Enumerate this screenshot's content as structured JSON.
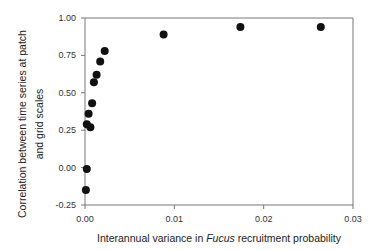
{
  "chart_data": {
    "type": "scatter",
    "title": "",
    "xlabel_parts": [
      "Interannual variance in ",
      "Fucus",
      " recruitment probability"
    ],
    "xlabel": "Interannual variance in Fucus recruitment probability",
    "ylabel_lines": [
      "Correlation between time series at patch",
      "and grid scales"
    ],
    "ylabel": "Correlation between time series at patch and grid scales",
    "xlim": [
      0,
      0.03
    ],
    "ylim": [
      -0.25,
      1.0
    ],
    "xticks": [
      0,
      0.01,
      0.02,
      0.03
    ],
    "xtick_labels": [
      "0.00",
      "0.01",
      "0.02",
      "0.03"
    ],
    "yticks": [
      -0.25,
      0,
      0.25,
      0.5,
      0.75,
      1.0
    ],
    "ytick_labels": [
      "-0.25",
      "0.00",
      "0.25",
      "0.50",
      "0.75",
      "1.00"
    ],
    "grid": false,
    "legend": null,
    "marker_color": "#111111",
    "series": [
      {
        "name": "correlation",
        "points": [
          {
            "x": 0.0001,
            "y": -0.15
          },
          {
            "x": 0.0002,
            "y": -0.01
          },
          {
            "x": 0.0002,
            "y": 0.29
          },
          {
            "x": 0.0006,
            "y": 0.27
          },
          {
            "x": 0.0004,
            "y": 0.36
          },
          {
            "x": 0.0008,
            "y": 0.43
          },
          {
            "x": 0.001,
            "y": 0.57
          },
          {
            "x": 0.0013,
            "y": 0.62
          },
          {
            "x": 0.0017,
            "y": 0.71
          },
          {
            "x": 0.0022,
            "y": 0.78
          },
          {
            "x": 0.0088,
            "y": 0.89
          },
          {
            "x": 0.0174,
            "y": 0.94
          },
          {
            "x": 0.0264,
            "y": 0.94
          }
        ]
      }
    ]
  }
}
